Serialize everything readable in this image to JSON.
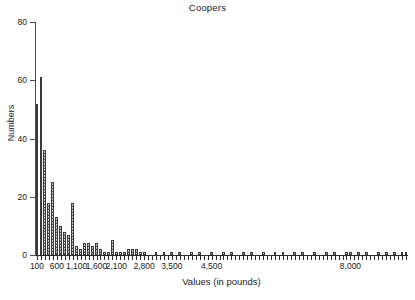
{
  "chart": {
    "title": "Coopers",
    "xlabel": "Values (in pounds)",
    "ylabel": "Numbers"
  },
  "chart_data": {
    "type": "bar",
    "title": "Coopers",
    "xlabel": "Values (in pounds)",
    "ylabel": "Numbers",
    "grid": false,
    "legend": null,
    "ylim": [
      0,
      80
    ],
    "y_ticks": [
      0,
      20,
      40,
      60,
      80
    ],
    "y_tick_labels": [
      "0",
      "20",
      "40",
      "60",
      "80"
    ],
    "x_tick_labels": [
      "100",
      "600",
      "1,100",
      "1,600",
      "2,100",
      "2,800",
      "3,500",
      "4,500",
      "8,000"
    ],
    "x_tick_bin_index": [
      0,
      5,
      10,
      15,
      20,
      27,
      34,
      44,
      79
    ],
    "bin_width": 100,
    "categories": [
      "100",
      "200",
      "300",
      "400",
      "500",
      "600",
      "700",
      "800",
      "900",
      "1,000",
      "1,100",
      "1,200",
      "1,300",
      "1,400",
      "1,500",
      "1,600",
      "1,700",
      "1,800",
      "1,900",
      "2,000",
      "2,100",
      "2,200",
      "2,300",
      "2,400",
      "2,500",
      "2,600",
      "2,700",
      "2,800",
      "2,900",
      "3,000",
      "3,100",
      "3,200",
      "3,300",
      "3,400",
      "3,500",
      "3,600",
      "3,700",
      "3,800",
      "3,900",
      "4,000",
      "4,100",
      "4,200",
      "4,300",
      "4,400",
      "4,500",
      "4,600",
      "4,700",
      "4,800",
      "4,900",
      "5,000",
      "5,100",
      "5,200",
      "5,300",
      "5,400",
      "5,500",
      "5,600",
      "5,700",
      "5,800",
      "5,900",
      "6,000",
      "6,100",
      "6,200",
      "6,300",
      "6,400",
      "6,500",
      "6,600",
      "6,700",
      "6,800",
      "6,900",
      "7,000",
      "7,100",
      "7,200",
      "7,300",
      "7,400",
      "7,500",
      "7,600",
      "7,700",
      "7,800",
      "7,900",
      "8,000",
      "8,100",
      "8,200",
      "8,300",
      "8,400",
      "8,500",
      "8,600",
      "8,700",
      "8,800",
      "8,900",
      "9,000",
      "9,100",
      "9,200",
      "9,300",
      "9,400"
    ],
    "values": [
      52,
      61,
      36,
      18,
      25,
      13,
      10,
      8,
      7,
      18,
      3,
      2,
      4,
      4,
      3,
      4,
      2,
      1,
      1,
      5,
      1,
      1,
      1,
      2,
      2,
      2,
      1,
      1,
      0,
      0,
      1,
      0,
      1,
      0,
      1,
      0,
      1,
      0,
      0,
      1,
      0,
      1,
      0,
      0,
      1,
      0,
      0,
      1,
      0,
      1,
      0,
      0,
      1,
      0,
      1,
      0,
      0,
      1,
      0,
      0,
      1,
      0,
      1,
      0,
      0,
      1,
      0,
      1,
      0,
      0,
      1,
      0,
      0,
      1,
      0,
      1,
      0,
      0,
      1,
      1,
      0,
      1,
      0,
      1,
      0,
      0,
      1,
      0,
      1,
      0,
      1,
      0,
      1,
      1
    ]
  }
}
